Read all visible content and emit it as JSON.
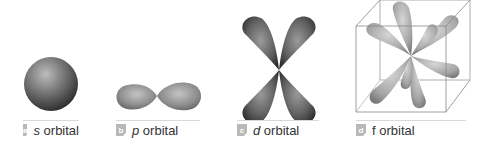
{
  "figure": {
    "panels": [
      {
        "badge": "a",
        "letter": "s",
        "suffix": " orbital",
        "shape": "sphere"
      },
      {
        "badge": "b",
        "letter": "p",
        "suffix": " orbital",
        "shape": "dumbbell"
      },
      {
        "badge": "c",
        "letter": "d",
        "suffix": " orbital",
        "shape": "cloverleaf"
      },
      {
        "badge": "d",
        "letter": "f",
        "suffix": " orbital",
        "shape": "multi-lobe in cube"
      }
    ],
    "colors": {
      "lobe_dark": "#3a3a3a",
      "lobe_light": "#bdbdbd",
      "badge": "#b8b8b8",
      "caption_text": "#333333",
      "cube_line": "#888888"
    }
  }
}
